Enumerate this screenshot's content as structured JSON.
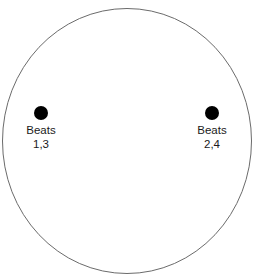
{
  "figure": {
    "type": "conducting-pattern-diagram",
    "background_color": "#ffffff",
    "circle": {
      "name": "conducting-circle",
      "stroke_color": "#6b6b6b",
      "fill_color": "#ffffff",
      "stroke_width": 1,
      "center_x": 127,
      "center_y": 141,
      "radius_x": 125,
      "radius_y": 133
    },
    "markers": [
      {
        "id": "beats-1-3",
        "dot_color": "#000000",
        "dot_radius": 7,
        "center_x": 41,
        "center_y": 114,
        "label_line1": "Beats",
        "label_line2": "1,3"
      },
      {
        "id": "beats-2-4",
        "dot_color": "#000000",
        "dot_radius": 7,
        "center_x": 212,
        "center_y": 114,
        "label_line1": "Beats",
        "label_line2": "2,4"
      }
    ]
  }
}
